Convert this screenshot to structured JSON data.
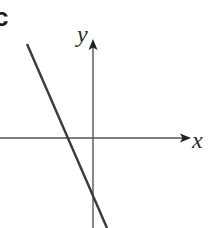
{
  "figure": {
    "panel_label": "c",
    "axes": {
      "x_label": "x",
      "y_label": "y"
    },
    "line": {
      "description": "straight line with negative slope",
      "slope_sign": "negative",
      "x_intercept_sign": "negative",
      "y_intercept_sign": "negative"
    },
    "colors": {
      "background": "#ffffff",
      "axis": "#555555",
      "line": "#3a3a3a",
      "text": "#2a2a2a"
    }
  }
}
